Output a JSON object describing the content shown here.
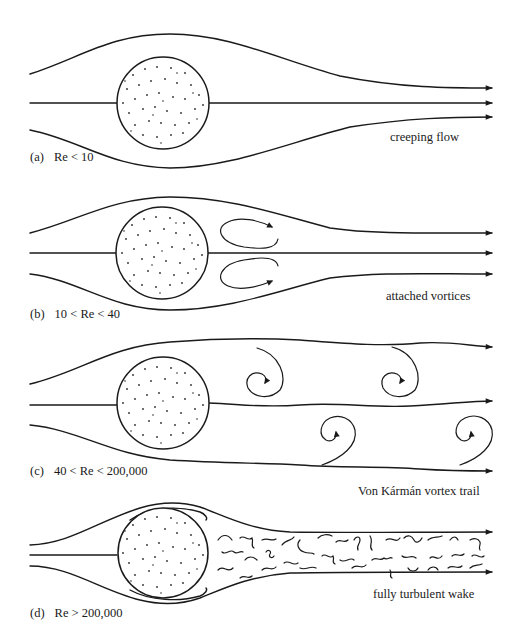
{
  "figure": {
    "colors": {
      "ink": "#1a1a1a",
      "background": "#ffffff"
    },
    "panels": [
      {
        "id": "a",
        "label": "(a)",
        "condition": "Re < 10",
        "caption": "creeping flow",
        "cylinder": {
          "cx": 163,
          "cy": 103,
          "r": 46
        },
        "streamline_count": 3,
        "wake": "none"
      },
      {
        "id": "b",
        "label": "(b)",
        "condition": "10 < Re < 40",
        "caption": "attached vortices",
        "cylinder": {
          "cx": 162,
          "cy": 253,
          "r": 46
        },
        "streamline_count": 3,
        "wake": "two attached counter-rotating vortices"
      },
      {
        "id": "c",
        "label": "(c)",
        "condition": "40 < Re < 200,000",
        "caption": "Von Kármán vortex trail",
        "cylinder": {
          "cx": 163,
          "cy": 403,
          "r": 46
        },
        "streamline_count": 3,
        "wake": "alternating shed vortices (4 spirals)"
      },
      {
        "id": "d",
        "label": "(d)",
        "condition": "Re > 200,000",
        "caption": "fully turbulent wake",
        "cylinder": {
          "cx": 163,
          "cy": 553,
          "r": 46
        },
        "streamline_count": 3,
        "wake": "turbulent eddies"
      }
    ]
  }
}
